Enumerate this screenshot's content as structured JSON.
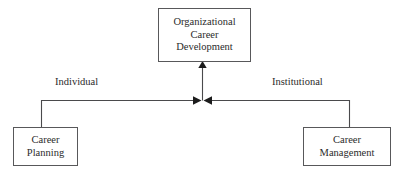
{
  "diagram": {
    "title_node": {
      "name": "organizational-career-development",
      "lines": [
        "Organizational",
        "Career",
        "Development"
      ],
      "line1": "Organizational",
      "line2": "Career",
      "line3": "Development"
    },
    "left_node": {
      "name": "career-planning",
      "lines": [
        "Career",
        "Planning"
      ],
      "line1": "Career",
      "line2": "Planning"
    },
    "right_node": {
      "name": "career-management",
      "lines": [
        "Career",
        "Management"
      ],
      "line1": "Career",
      "line2": "Management"
    },
    "edge_labels": {
      "left": "Individual",
      "right": "Institutional"
    },
    "connectors": [
      {
        "name": "career-planning-to-junction",
        "from": "career-planning",
        "to": "junction",
        "label": "Individual",
        "arrowhead": "right"
      },
      {
        "name": "career-management-to-junction",
        "from": "career-management",
        "to": "junction",
        "label": "Institutional",
        "arrowhead": "left"
      },
      {
        "name": "junction-to-organizational-career-development",
        "from": "junction",
        "to": "organizational-career-development",
        "label": "",
        "arrowhead": "up"
      }
    ],
    "colors": {
      "background": "#ffffff",
      "border": "#58585a",
      "text": "#2b2b2b",
      "line": "#4a4a4c",
      "arrow": "#1c1c1c"
    }
  }
}
